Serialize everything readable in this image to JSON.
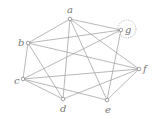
{
  "graph": {
    "nodes": [
      {
        "id": "a",
        "label": "a",
        "x": 70,
        "y": 19,
        "lx": 67,
        "ly": 13
      },
      {
        "id": "b",
        "label": "b",
        "x": 28,
        "y": 43,
        "lx": 18,
        "ly": 46
      },
      {
        "id": "c",
        "label": "c",
        "x": 23,
        "y": 79,
        "lx": 14,
        "ly": 84
      },
      {
        "id": "d",
        "label": "d",
        "x": 63,
        "y": 99,
        "lx": 60,
        "ly": 112
      },
      {
        "id": "e",
        "label": "e",
        "x": 107,
        "y": 100,
        "lx": 105,
        "ly": 113
      },
      {
        "id": "f",
        "label": "f",
        "x": 139,
        "y": 69,
        "lx": 143,
        "ly": 72
      },
      {
        "id": "g",
        "label": "g",
        "x": 121,
        "y": 30,
        "lx": 125,
        "ly": 33
      }
    ],
    "edges": [
      [
        "a",
        "b"
      ],
      [
        "a",
        "g"
      ],
      [
        "a",
        "f"
      ],
      [
        "a",
        "d"
      ],
      [
        "a",
        "e"
      ],
      [
        "b",
        "c"
      ],
      [
        "b",
        "g"
      ],
      [
        "b",
        "f"
      ],
      [
        "b",
        "d"
      ],
      [
        "c",
        "g"
      ],
      [
        "c",
        "f"
      ],
      [
        "c",
        "d"
      ],
      [
        "c",
        "e"
      ],
      [
        "d",
        "f"
      ],
      [
        "e",
        "g"
      ],
      [
        "e",
        "f"
      ]
    ],
    "highlight": {
      "node": "g",
      "cx": 127,
      "cy": 29,
      "r": 9,
      "style": "dotted-circle"
    }
  }
}
